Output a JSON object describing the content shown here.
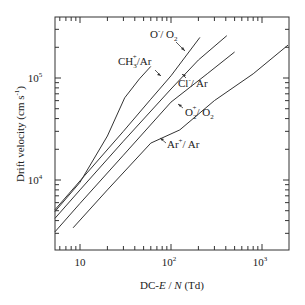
{
  "chart_data": {
    "type": "line",
    "title": "",
    "xlabel": "DC-E / N (Td)",
    "ylabel": "Drift velocity (cm s⁻¹)",
    "xscale": "log",
    "yscale": "log",
    "xlim": [
      5.3,
      1930
    ],
    "ylim": [
      2000,
      400000
    ],
    "x_ticks": [
      {
        "value": 10,
        "label": "10"
      },
      {
        "value": 100,
        "label": "10²"
      },
      {
        "value": 1000,
        "label": "10³"
      }
    ],
    "y_ticks": [
      {
        "value": 10000,
        "label": "10⁴"
      },
      {
        "value": 100000,
        "label": "10⁵"
      }
    ],
    "grid": false,
    "legend": "inline annotations with arrows",
    "series": [
      {
        "name": "O⁻/O₂",
        "label_main": "O",
        "label_sup": "-",
        "label_rest": "/ O₂",
        "x": [
          5.3,
          10,
          30,
          60,
          100,
          208
        ],
        "y": [
          5100,
          9800,
          30000,
          62000,
          105000,
          250000
        ]
      },
      {
        "name": "CH₃⁺/Ar",
        "label_main": "CH",
        "label_sub": "3",
        "label_sup": "+",
        "label_rest": "/Ar",
        "x": [
          5.3,
          10,
          20,
          31,
          45,
          60
        ],
        "y": [
          4900,
          9500,
          27000,
          64000,
          98000,
          130000
        ]
      },
      {
        "name": "Cl⁻/Ar",
        "label_main": "Cl",
        "label_sup": "-",
        "label_rest": "/ Ar",
        "x": [
          5.3,
          10,
          30,
          100,
          200,
          410
        ],
        "y": [
          4200,
          8000,
          24000,
          78000,
          150000,
          260000
        ]
      },
      {
        "name": "O₂⁺/O₂",
        "label_main": "O",
        "label_sub": "2",
        "label_sup": "+",
        "label_rest": "/ O₂",
        "x": [
          5.3,
          10,
          30,
          100,
          250,
          500
        ],
        "y": [
          3100,
          5900,
          17500,
          58000,
          110000,
          180000
        ]
      },
      {
        "name": "Ar⁺/Ar",
        "label_main": "Ar",
        "label_sup": "+",
        "label_rest": "/ Ar",
        "x": [
          8.4,
          20,
          60,
          125,
          300,
          800,
          1930
        ],
        "y": [
          3400,
          8000,
          23000,
          31000,
          60000,
          110000,
          210000
        ]
      }
    ]
  },
  "labels": {
    "xlabel_prefix": "DC-",
    "xlabel_E": "E",
    "xlabel_sep": " / ",
    "xlabel_N": "N",
    "xlabel_unit": "  (Td)",
    "ylabel": "Drift velocity  (cm s",
    "ylabel_sup": "-1",
    "ylabel_close": ")",
    "tick_10": "10",
    "tick_10_base": "10",
    "tick_2": "2",
    "tick_3": "3",
    "tick_4": "4",
    "tick_5": "5",
    "ann_O": "O",
    "ann_O_sup": "-",
    "ann_O_rest": "/ O",
    "ann_O_sub": "2",
    "ann_CH": "CH",
    "ann_CH_sub": "3",
    "ann_CH_sup": "+",
    "ann_CH_rest": "/Ar",
    "ann_Cl": "Cl",
    "ann_Cl_sup": "-",
    "ann_Cl_rest": "/ Ar",
    "ann_O2": "O",
    "ann_O2_sub": "2",
    "ann_O2_sup": "+",
    "ann_O2_rest": "/ O",
    "ann_O2_sub2": "2",
    "ann_Ar": "Ar",
    "ann_Ar_sup": "+",
    "ann_Ar_rest": "/ Ar"
  }
}
